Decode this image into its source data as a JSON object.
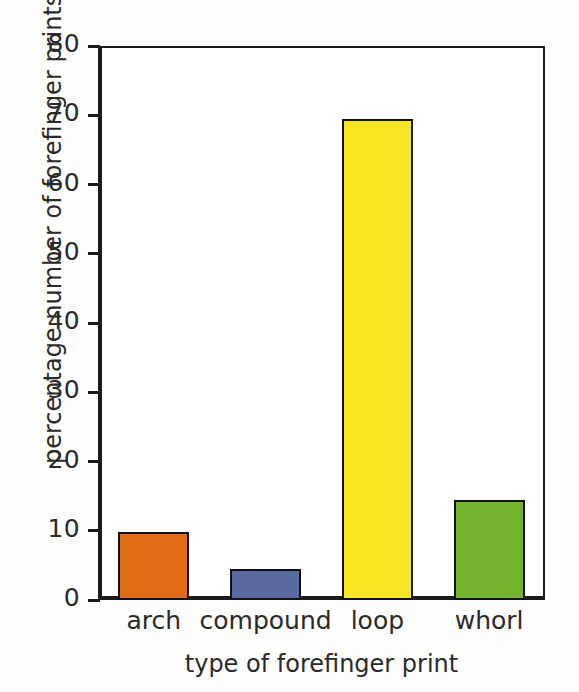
{
  "chart_data": {
    "type": "bar",
    "title": "",
    "subtitle": "",
    "categories": [
      "arch",
      "compound",
      "loop",
      "whorl"
    ],
    "values": [
      9.8,
      4.5,
      69.5,
      14.5
    ],
    "colors": [
      "#E06C18",
      "#5A69A0",
      "#F5E523",
      "#73B22B"
    ],
    "xlabel": "type of forefinger print",
    "ylabel": "percentage number of forefinger prints",
    "ylim": [
      0,
      80
    ],
    "ytick_labels": [
      "0",
      "10",
      "20",
      "30",
      "40",
      "50",
      "60",
      "70",
      "80"
    ],
    "ytick_values": [
      0,
      10,
      20,
      30,
      40,
      50,
      60,
      70,
      80
    ],
    "ytick_step": 10,
    "grid": false,
    "legend": false,
    "legend_position": "none",
    "bar_edge_color": "#111111",
    "axis_color": "#1b1b1b",
    "plot_background": "#ffffff",
    "figure_background": "#fdfdfc"
  },
  "axes": {
    "y_title": "percentage number of forefinger prints",
    "x_title": "type of forefinger print"
  }
}
